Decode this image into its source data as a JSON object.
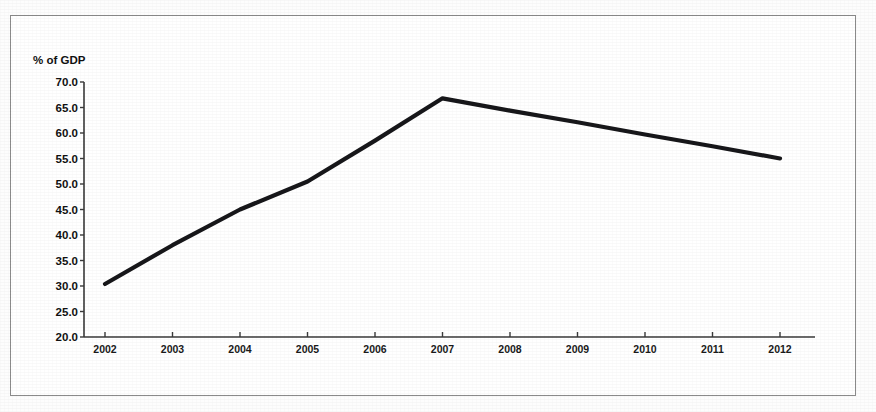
{
  "chart_data": {
    "type": "line",
    "title": "",
    "subtitle": "",
    "xlabel": "",
    "ylabel": "% of GDP",
    "categories": [
      "2002",
      "2003",
      "2004",
      "2005",
      "2006",
      "2007",
      "2008",
      "2009",
      "2010",
      "2011",
      "2012"
    ],
    "series": [
      {
        "name": "% of GDP",
        "values": [
          30.4,
          38.0,
          45.0,
          50.5,
          58.5,
          66.8,
          64.4,
          62.1,
          59.7,
          57.4,
          55.0
        ],
        "color": "#17171A",
        "marker": "none",
        "line_width": 4.2
      }
    ],
    "x_tick_labels": [
      "2002",
      "2003",
      "2004",
      "2005",
      "2006",
      "2007",
      "2008",
      "2009",
      "2010",
      "2011",
      "2012"
    ],
    "y_tick_labels": [
      "70.0",
      "65.0",
      "60.0",
      "55.0",
      "50.0",
      "45.0",
      "40.0",
      "35.0",
      "30.0",
      "25.0",
      "20.0"
    ],
    "y_tick_values": [
      70.0,
      65.0,
      60.0,
      55.0,
      50.0,
      45.0,
      40.0,
      35.0,
      30.0,
      25.0,
      20.0
    ],
    "ylim": [
      20.0,
      70.0
    ],
    "y_tick_step": 5.0,
    "grid": false,
    "legend": false,
    "legend_position": "none",
    "annotations": [],
    "peak_year": "2007",
    "peak_value": 66.8,
    "background_color": "#FFFFFF",
    "axis_color": "#3A3A3A",
    "frame_color": "#8B8B8B"
  }
}
